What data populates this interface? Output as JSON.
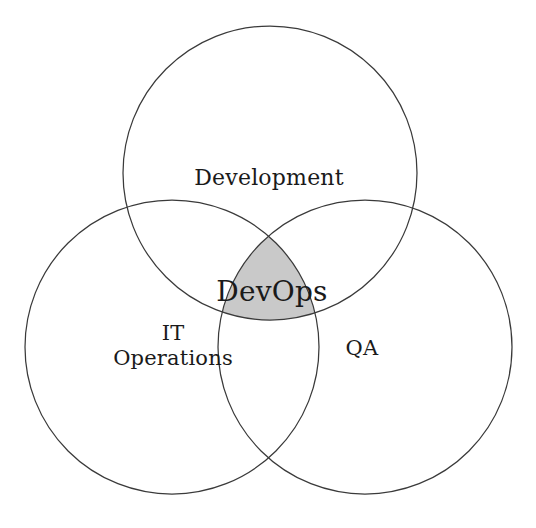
{
  "diagram": {
    "type": "venn",
    "background_color": "#ffffff",
    "stroke_color": "#3a3a3a",
    "text_color": "#1a1a1a",
    "intersection_fill_color": "#c9c9c9",
    "canvas": {
      "width": 536,
      "height": 528
    }
  },
  "sets": [
    {
      "id": "development",
      "label": "Development",
      "position": "top",
      "center_x": 270,
      "center_y": 173,
      "radius": 147,
      "label_x": 269,
      "label_y": 178
    },
    {
      "id": "it-operations",
      "label_line_1": "IT",
      "label_line_2": "Operations",
      "position": "bottom-left",
      "center_x": 172,
      "center_y": 347,
      "radius": 147,
      "label_x": 173,
      "label_y": 346
    },
    {
      "id": "qa",
      "label": "QA",
      "position": "bottom-right",
      "center_x": 365,
      "center_y": 347,
      "radius": 147,
      "label_x": 362,
      "label_y": 348
    }
  ],
  "intersection": {
    "id": "devops",
    "label": "DevOps",
    "label_x": 272,
    "label_y": 292,
    "fill_color": "#c9c9c9",
    "members": [
      "Development",
      "IT Operations",
      "QA"
    ]
  },
  "chart_data": {
    "type": "venn",
    "sets": [
      "Development",
      "IT Operations",
      "QA"
    ],
    "highlighted_region": "DevOps",
    "highlighted_region_members": [
      "Development",
      "IT Operations",
      "QA"
    ],
    "set_radii": [
      147,
      147,
      147
    ],
    "set_centers": [
      [
        270,
        173
      ],
      [
        172,
        347
      ],
      [
        365,
        347
      ]
    ],
    "legend": "none",
    "grid": false
  }
}
